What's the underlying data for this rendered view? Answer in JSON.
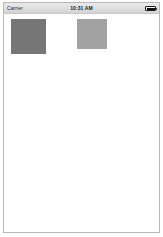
{
  "device": {
    "name": "ios-simulator-frame"
  },
  "status_bar": {
    "carrier": "Carrier",
    "wifi_icon": "wifi-icon",
    "time": "10:31 AM",
    "battery_icon": "battery-full-icon",
    "background_color": "#dedede",
    "text_color": "#222222"
  },
  "content": {
    "background_color": "#ffffff",
    "placeholders": [
      {
        "name": "image-placeholder-large",
        "color": "#767676",
        "width": 35,
        "height": 35
      },
      {
        "name": "image-placeholder-small",
        "color": "#a2a2a2",
        "width": 30,
        "height": 30
      }
    ]
  }
}
